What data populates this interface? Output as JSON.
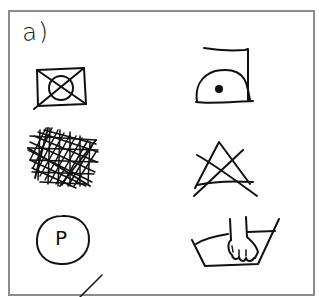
{
  "figure": {
    "section_label": "a)",
    "frame_color": "#8c8c8c",
    "ink_color": "#111111",
    "symbols": [
      {
        "id": "tumble-dry-prohibited",
        "description": "Square with inner circle crossed out",
        "position": "row1-left"
      },
      {
        "id": "ironing-low-heat",
        "description": "Iron with one dot",
        "position": "row1-right"
      },
      {
        "id": "scribbled-out-symbol",
        "description": "Heavily crossed-out scribble",
        "position": "row2-left"
      },
      {
        "id": "bleach-prohibited",
        "description": "Triangle crossed out",
        "position": "row2-right"
      },
      {
        "id": "dry-clean-p",
        "description": "Circle with letter P",
        "letter": "P",
        "position": "row3-left"
      },
      {
        "id": "hand-wash",
        "description": "Wash tub with hand",
        "position": "row3-right"
      }
    ]
  }
}
